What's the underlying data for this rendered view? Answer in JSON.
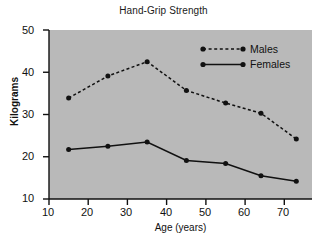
{
  "chart_data": {
    "type": "line",
    "title": "Hand-Grip Strength",
    "xlabel": "Age (years)",
    "ylabel": "Kilograms",
    "xlim": [
      10,
      77
    ],
    "ylim": [
      10,
      50
    ],
    "xticks": [
      10,
      20,
      30,
      40,
      50,
      60,
      70
    ],
    "xtick_labels": [
      "10",
      "20",
      "30",
      "40",
      "50",
      "60",
      "70"
    ],
    "yticks": [
      10,
      20,
      30,
      40,
      50
    ],
    "ytick_labels": [
      "10",
      "20",
      "30",
      "40",
      "50"
    ],
    "grid": false,
    "legend_position": "upper right",
    "plot_background": "#b9b9b9",
    "series": [
      {
        "name": "Males",
        "line_style": "dashed",
        "color": "#111111",
        "marker": "circle",
        "x": [
          15,
          25,
          35,
          45,
          55,
          64,
          73
        ],
        "values": [
          33.9,
          39.1,
          42.5,
          35.7,
          32.7,
          30.3,
          24.2
        ]
      },
      {
        "name": "Females",
        "line_style": "solid",
        "color": "#111111",
        "marker": "circle",
        "x": [
          15,
          25,
          35,
          45,
          55,
          64,
          73
        ],
        "values": [
          21.7,
          22.5,
          23.5,
          19.1,
          18.4,
          15.5,
          14.2
        ]
      }
    ]
  },
  "legend": {
    "males_label": "Males",
    "females_label": "Females"
  },
  "axis": {
    "y_title": "Kilograms",
    "x_title": "Age (years)",
    "y_tick_50": "50",
    "y_tick_40": "40",
    "y_tick_30": "30",
    "y_tick_20": "20",
    "y_tick_10": "10",
    "x_tick_10": "10",
    "x_tick_20": "20",
    "x_tick_30": "30",
    "x_tick_40": "40",
    "x_tick_50": "50",
    "x_tick_60": "60",
    "x_tick_70": "70"
  },
  "header": {
    "title": "Hand-Grip Strength"
  }
}
